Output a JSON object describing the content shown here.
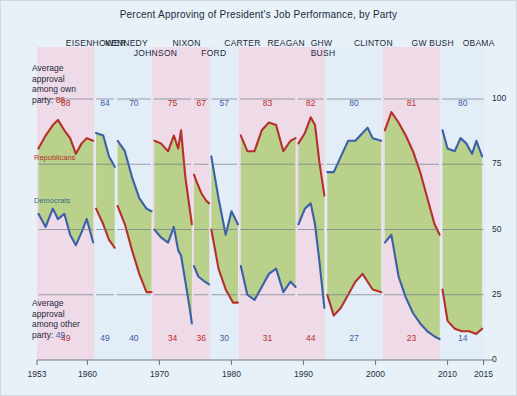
{
  "title": "Percent Approving of President's Job Performance, by Party",
  "notes": {
    "own_party": "Average\napproval\namong own\nparty:",
    "own_party_lines": [
      "Average",
      "approval",
      "among own",
      "party:"
    ],
    "own_party_value": "88",
    "other_party_lines": [
      "Average",
      "approval",
      "among other",
      "party:"
    ],
    "other_party_value": "49"
  },
  "series_labels": {
    "republicans": "Republicans",
    "democrats": "Democrats"
  },
  "colors": {
    "republican_line": "#b5302c",
    "democrat_line": "#3b5fa8",
    "gap_fill": "#b9d18a",
    "background": "#e8f0f8",
    "republican_band": "#efdae7",
    "democrat_band": "#e2edf7",
    "axis": "#6b7a88",
    "gridline": "#6b7a88"
  },
  "y_axis": {
    "label": "",
    "ticks": [
      "100",
      "75",
      "50",
      "25",
      "0"
    ],
    "range": [
      0,
      100
    ]
  },
  "x_axis": {
    "label": "",
    "ticks": [
      "1953",
      "1960",
      "1970",
      "1980",
      "1990",
      "2000",
      "2010",
      "2015"
    ],
    "range": [
      1953,
      2015
    ]
  },
  "presidents": [
    {
      "name": "EISENHOWER",
      "party": "R",
      "start": 1953.0,
      "end": 1961.0,
      "own": "88",
      "other": "49",
      "label_row": 0
    },
    {
      "name": "KENNEDY",
      "party": "D",
      "start": 1961.0,
      "end": 1963.9,
      "own": "84",
      "other": "49",
      "label_row": 0
    },
    {
      "name": "JOHNSON",
      "party": "D",
      "start": 1963.9,
      "end": 1969.0,
      "own": "70",
      "other": "40",
      "label_row": 1
    },
    {
      "name": "NIXON",
      "party": "R",
      "start": 1969.0,
      "end": 1974.6,
      "own": "75",
      "other": "34",
      "label_row": 0
    },
    {
      "name": "FORD",
      "party": "R",
      "start": 1974.6,
      "end": 1977.0,
      "own": "67",
      "other": "36",
      "label_row": 1
    },
    {
      "name": "CARTER",
      "party": "D",
      "start": 1977.0,
      "end": 1981.0,
      "own": "57",
      "other": "30",
      "label_row": 0
    },
    {
      "name": "REAGAN",
      "party": "R",
      "start": 1981.0,
      "end": 1989.0,
      "own": "83",
      "other": "31",
      "label_row": 0
    },
    {
      "name": "GHW\nBUSH",
      "party": "R",
      "start": 1989.0,
      "end": 1993.0,
      "own": "82",
      "other": "44",
      "label_row": 0
    },
    {
      "name": "CLINTON",
      "party": "D",
      "start": 1993.0,
      "end": 2001.0,
      "own": "80",
      "other": "27",
      "label_row": 0
    },
    {
      "name": "GW BUSH",
      "party": "R",
      "start": 2001.0,
      "end": 2009.0,
      "own": "81",
      "other": "23",
      "label_row": 0
    },
    {
      "name": "OBAMA",
      "party": "D",
      "start": 2009.0,
      "end": 2015.2,
      "own": "80",
      "other": "14",
      "label_row": 0
    }
  ],
  "chart_data": {
    "type": "line",
    "title": "Percent Approving of President's Job Performance, by Party",
    "xlabel": "",
    "ylabel": "Percent approving",
    "xlim": [
      1953,
      2015
    ],
    "ylim": [
      0,
      100
    ],
    "grid": "horizontal-partial",
    "legend": "inline-annotation",
    "annotations": [
      "Average approval among own party: 88 49 84 70 75 67 57 83 82 80 81 80",
      "Average approval among other party: 49 49 40 34 36 30 31 44 27 23 14"
    ],
    "series": [
      {
        "name": "Republicans",
        "color": "#b5302c",
        "segments": [
          {
            "president": "EISENHOWER",
            "points": [
              [
                1953.2,
                81
              ],
              [
                1954.2,
                86
              ],
              [
                1955.2,
                90
              ],
              [
                1955.9,
                92
              ],
              [
                1956.8,
                88
              ],
              [
                1957.6,
                85
              ],
              [
                1958.4,
                79
              ],
              [
                1959.2,
                83
              ],
              [
                1959.9,
                85
              ],
              [
                1960.8,
                84
              ]
            ]
          },
          {
            "president": "KENNEDY",
            "points": [
              [
                1961.2,
                58
              ],
              [
                1962.2,
                52
              ],
              [
                1963.0,
                46
              ],
              [
                1963.8,
                43
              ]
            ]
          },
          {
            "president": "JOHNSON",
            "points": [
              [
                1964.2,
                59
              ],
              [
                1965.2,
                52
              ],
              [
                1966.2,
                42
              ],
              [
                1967.2,
                33
              ],
              [
                1968.2,
                26
              ],
              [
                1968.9,
                26
              ]
            ]
          },
          {
            "president": "NIXON",
            "points": [
              [
                1969.3,
                84
              ],
              [
                1970.2,
                83
              ],
              [
                1971.2,
                80
              ],
              [
                1972.0,
                86
              ],
              [
                1972.6,
                81
              ],
              [
                1973.0,
                88
              ],
              [
                1973.6,
                70
              ],
              [
                1974.2,
                58
              ],
              [
                1974.5,
                52
              ]
            ]
          },
          {
            "president": "FORD",
            "points": [
              [
                1974.8,
                71
              ],
              [
                1975.2,
                68
              ],
              [
                1975.8,
                64
              ],
              [
                1976.5,
                61
              ],
              [
                1976.9,
                60
              ]
            ]
          },
          {
            "president": "CARTER",
            "points": [
              [
                1977.2,
                50
              ],
              [
                1978.2,
                35
              ],
              [
                1979.2,
                27
              ],
              [
                1980.2,
                22
              ],
              [
                1980.9,
                22
              ]
            ]
          },
          {
            "president": "REAGAN",
            "points": [
              [
                1981.3,
                86
              ],
              [
                1982.2,
                80
              ],
              [
                1983.2,
                80
              ],
              [
                1984.2,
                88
              ],
              [
                1985.2,
                91
              ],
              [
                1986.2,
                90
              ],
              [
                1987.2,
                80
              ],
              [
                1988.2,
                84
              ],
              [
                1988.9,
                85
              ]
            ]
          },
          {
            "president": "GHW BUSH",
            "points": [
              [
                1989.3,
                83
              ],
              [
                1990.2,
                87
              ],
              [
                1991.0,
                93
              ],
              [
                1991.6,
                90
              ],
              [
                1992.2,
                76
              ],
              [
                1992.9,
                63
              ]
            ]
          },
          {
            "president": "CLINTON",
            "points": [
              [
                1993.3,
                25
              ],
              [
                1994.2,
                17
              ],
              [
                1995.2,
                20
              ],
              [
                1996.2,
                25
              ],
              [
                1997.2,
                30
              ],
              [
                1998.2,
                33
              ],
              [
                1998.9,
                30
              ],
              [
                1999.6,
                27
              ],
              [
                2000.8,
                26
              ]
            ]
          },
          {
            "president": "GW BUSH",
            "points": [
              [
                2001.3,
                88
              ],
              [
                2002.2,
                95
              ],
              [
                2003.2,
                91
              ],
              [
                2004.2,
                86
              ],
              [
                2005.2,
                80
              ],
              [
                2006.2,
                72
              ],
              [
                2007.2,
                62
              ],
              [
                2008.2,
                52
              ],
              [
                2008.9,
                48
              ]
            ]
          },
          {
            "president": "OBAMA",
            "points": [
              [
                2009.3,
                27
              ],
              [
                2010.0,
                15
              ],
              [
                2011.0,
                12
              ],
              [
                2012.0,
                11
              ],
              [
                2013.0,
                11
              ],
              [
                2014.0,
                10
              ],
              [
                2014.8,
                12
              ]
            ]
          }
        ]
      },
      {
        "name": "Democrats",
        "color": "#3b5fa8",
        "segments": [
          {
            "president": "EISENHOWER",
            "points": [
              [
                1953.2,
                56
              ],
              [
                1954.2,
                51
              ],
              [
                1955.2,
                58
              ],
              [
                1955.9,
                54
              ],
              [
                1956.8,
                56
              ],
              [
                1957.6,
                48
              ],
              [
                1958.4,
                44
              ],
              [
                1959.2,
                49
              ],
              [
                1959.9,
                54
              ],
              [
                1960.8,
                45
              ]
            ]
          },
          {
            "president": "KENNEDY",
            "points": [
              [
                1961.2,
                87
              ],
              [
                1962.2,
                86
              ],
              [
                1963.0,
                78
              ],
              [
                1963.8,
                74
              ]
            ]
          },
          {
            "president": "JOHNSON",
            "points": [
              [
                1964.2,
                84
              ],
              [
                1965.2,
                80
              ],
              [
                1966.2,
                70
              ],
              [
                1967.2,
                62
              ],
              [
                1968.2,
                58
              ],
              [
                1968.9,
                57
              ]
            ]
          },
          {
            "president": "NIXON",
            "points": [
              [
                1969.3,
                50
              ],
              [
                1970.2,
                47
              ],
              [
                1971.2,
                45
              ],
              [
                1972.0,
                51
              ],
              [
                1972.6,
                42
              ],
              [
                1973.0,
                40
              ],
              [
                1973.6,
                30
              ],
              [
                1974.2,
                20
              ],
              [
                1974.5,
                14
              ]
            ]
          },
          {
            "president": "FORD",
            "points": [
              [
                1974.8,
                36
              ],
              [
                1975.4,
                32
              ],
              [
                1976.3,
                30
              ],
              [
                1976.9,
                29
              ]
            ]
          },
          {
            "president": "CARTER",
            "points": [
              [
                1977.2,
                78
              ],
              [
                1978.2,
                62
              ],
              [
                1979.2,
                48
              ],
              [
                1980.0,
                57
              ],
              [
                1980.9,
                52
              ]
            ]
          },
          {
            "president": "REAGAN",
            "points": [
              [
                1981.3,
                36
              ],
              [
                1982.2,
                25
              ],
              [
                1983.2,
                23
              ],
              [
                1984.2,
                28
              ],
              [
                1985.2,
                33
              ],
              [
                1986.2,
                35
              ],
              [
                1987.2,
                26
              ],
              [
                1988.2,
                30
              ],
              [
                1988.9,
                28
              ]
            ]
          },
          {
            "president": "GHW BUSH",
            "points": [
              [
                1989.3,
                52
              ],
              [
                1990.2,
                58
              ],
              [
                1991.0,
                60
              ],
              [
                1991.6,
                52
              ],
              [
                1992.2,
                38
              ],
              [
                1992.9,
                20
              ]
            ]
          },
          {
            "president": "CLINTON",
            "points": [
              [
                1993.3,
                72
              ],
              [
                1994.2,
                72
              ],
              [
                1995.2,
                78
              ],
              [
                1996.2,
                84
              ],
              [
                1997.2,
                84
              ],
              [
                1998.2,
                87
              ],
              [
                1998.9,
                89
              ],
              [
                1999.6,
                85
              ],
              [
                2000.8,
                84
              ]
            ]
          },
          {
            "president": "GW BUSH",
            "points": [
              [
                2001.3,
                45
              ],
              [
                2002.2,
                48
              ],
              [
                2003.2,
                32
              ],
              [
                2004.2,
                24
              ],
              [
                2005.2,
                18
              ],
              [
                2006.2,
                14
              ],
              [
                2007.2,
                11
              ],
              [
                2008.2,
                9
              ],
              [
                2008.9,
                8
              ]
            ]
          },
          {
            "president": "OBAMA",
            "points": [
              [
                2009.3,
                88
              ],
              [
                2010.0,
                81
              ],
              [
                2011.0,
                80
              ],
              [
                2011.8,
                85
              ],
              [
                2012.6,
                83
              ],
              [
                2013.4,
                79
              ],
              [
                2014.0,
                84
              ],
              [
                2014.8,
                78
              ]
            ]
          }
        ]
      }
    ]
  }
}
